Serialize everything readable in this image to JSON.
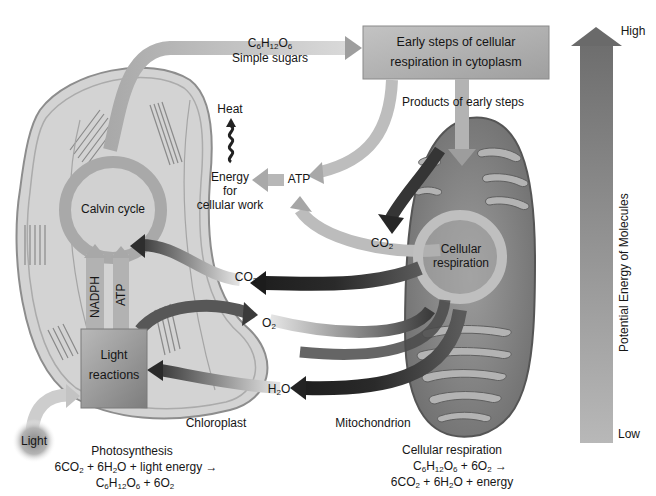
{
  "figure": {
    "sugar_label": {
      "formula": "C6H12O6",
      "name": "Simple sugars"
    },
    "early_steps_box": {
      "line1": "Early steps of cellular",
      "line2": "respiration in cytoplasm"
    },
    "products_label": "Products of early steps",
    "heat_label": "Heat",
    "energy_label": {
      "line1": "Energy",
      "line2": "for",
      "line3": "cellular work"
    },
    "atp_label": "ATP",
    "calvin_label": "Calvin cycle",
    "co2_upper_label": "CO2",
    "co2_middle_label": "CO2",
    "o2_label": "O2",
    "h2o_label": "H2O",
    "nadph_label": "NADPH",
    "atp_vertical_label": "ATP",
    "light_reactions_label": {
      "line1": "Light",
      "line2": "reactions"
    },
    "cellular_respiration_circle": {
      "line1": "Cellular",
      "line2": "respiration"
    },
    "chloroplast_label": "Chloroplast",
    "mitochondrion_label": "Mitochondrion",
    "light_label": "Light",
    "photosynthesis": {
      "title": "Photosynthesis",
      "equation_line1": "6CO2 + 6H2O + light energy →",
      "equation_line2": "C6H12O6 + 6O2"
    },
    "cellular_respiration": {
      "title": "Cellular respiration",
      "equation_line1": "C6H12O6 + 6O2 →",
      "equation_line2": "6CO2 + 6H2O + energy"
    },
    "energy_axis": {
      "label": "Potential Energy of Molecules",
      "high": "High",
      "low": "Low"
    }
  },
  "colors": {
    "background": "#ffffff",
    "organelle_fill": "#c9c9c9",
    "chloroplast_fill": "#d4d4d4",
    "mitochondrion_fill": "#8e8e8e",
    "arrow_light": "#b8b8b8",
    "arrow_dark": "#2b2b2b",
    "box_fill": "#b0b0b0",
    "text": "#161616"
  }
}
